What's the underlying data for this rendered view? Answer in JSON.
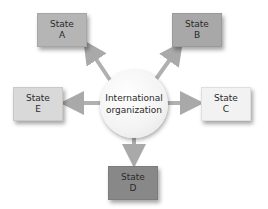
{
  "diagram": {
    "center": {
      "line1": "International",
      "line2": "organization"
    },
    "nodes": [
      {
        "id": "A",
        "label": "State",
        "letter": "A",
        "color": "#b5b5b5"
      },
      {
        "id": "B",
        "label": "State",
        "letter": "B",
        "color": "#a8a8a8"
      },
      {
        "id": "C",
        "label": "State",
        "letter": "C",
        "color": "#f2f2f2"
      },
      {
        "id": "D",
        "label": "State",
        "letter": "D",
        "color": "#888888"
      },
      {
        "id": "E",
        "label": "State",
        "letter": "E",
        "color": "#d9d9d9"
      }
    ],
    "arrow_color": "#a9a9a9",
    "edges": [
      {
        "from": "center",
        "to": "A"
      },
      {
        "from": "center",
        "to": "B"
      },
      {
        "from": "center",
        "to": "C"
      },
      {
        "from": "center",
        "to": "D"
      },
      {
        "from": "center",
        "to": "E"
      }
    ]
  }
}
